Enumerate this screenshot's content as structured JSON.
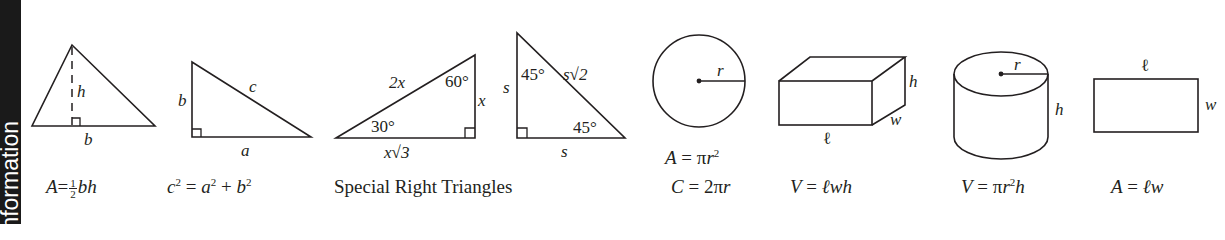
{
  "side_bar": {
    "text": "Information",
    "visible_text": "formation",
    "background": "#1a1a1a",
    "text_color": "#ffffff"
  },
  "figures": [
    {
      "id": "triangle",
      "labels": {
        "height": "h",
        "base": "b"
      },
      "formula": {
        "lhs": "A",
        "eq": "=",
        "frac_num": "1",
        "frac_den": "2",
        "rhs": "bh"
      }
    },
    {
      "id": "right-triangle",
      "labels": {
        "leg_vertical": "b",
        "hypotenuse": "c",
        "leg_horizontal": "a"
      },
      "formula": {
        "c": "c",
        "a": "a",
        "b": "b",
        "exp": "2",
        "eq": "=",
        "plus": "+"
      }
    },
    {
      "id": "special-right-triangles",
      "caption": "Special Right Triangles",
      "t30_60_90": {
        "hypotenuse": "2x",
        "short_leg": "x",
        "long_leg": "x√3",
        "angle_top": "60°",
        "angle_left": "30°"
      },
      "t45_45_90": {
        "leg_vertical": "s",
        "leg_horizontal": "s",
        "hypotenuse": "s√2",
        "angle_top": "45°",
        "angle_right": "45°"
      }
    },
    {
      "id": "circle",
      "labels": {
        "radius": "r"
      },
      "formula_area": {
        "lhs": "A",
        "eq": "=",
        "pi": "π",
        "r": "r",
        "exp": "2"
      },
      "formula_circumference": {
        "lhs": "C",
        "eq": "=",
        "coef": "2π",
        "r": "r"
      }
    },
    {
      "id": "rectangular-prism",
      "labels": {
        "length": "ℓ",
        "width": "w",
        "height": "h"
      },
      "formula": {
        "lhs": "V",
        "eq": "=",
        "rhs": "ℓwh"
      }
    },
    {
      "id": "cylinder",
      "labels": {
        "radius": "r",
        "height": "h"
      },
      "formula": {
        "lhs": "V",
        "eq": "=",
        "pi": "π",
        "r": "r",
        "exp": "2",
        "h": "h"
      }
    },
    {
      "id": "rectangle",
      "labels": {
        "length": "ℓ",
        "width": "w"
      },
      "formula": {
        "lhs": "A",
        "eq": "=",
        "rhs": "ℓw"
      }
    }
  ]
}
